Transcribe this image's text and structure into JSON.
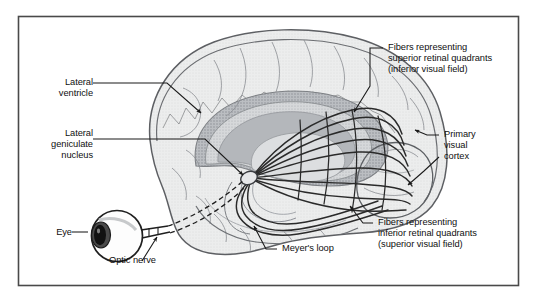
{
  "figure": {
    "frame_color": "#4a4a4a",
    "background_color": "#ffffff",
    "ink_color": "#1a1a1a"
  },
  "palette": {
    "cortex_fill": "#e9eaec",
    "cortex_stroke": "#5d5f63",
    "ventricle_outer": "#b9bcc0",
    "ventricle_inner": "#cfd2d5",
    "ventricle_core": "#a9acb1",
    "sulci_stroke": "#8a8d92",
    "fiber_stroke": "#2a2a2a",
    "eye_fill": "#fdfdfd",
    "iris_fill": "#3c3c3c",
    "pupil_fill": "#111111",
    "leader_stroke": "#1a1a1a"
  },
  "labels": {
    "lateral_ventricle": {
      "id": "lateral-ventricle",
      "lines": [
        "Lateral",
        "ventricle"
      ],
      "text": "Lateral\nventricle",
      "align": "right",
      "x": 38,
      "y": 77
    },
    "lateral_geniculate_nucleus": {
      "id": "lateral-geniculate-nucleus",
      "lines": [
        "Lateral",
        "geniculate",
        "nucleus"
      ],
      "text": "Lateral\ngeniculate\nnucleus",
      "align": "right",
      "x": 24,
      "y": 128
    },
    "eye": {
      "id": "eye",
      "lines": [
        "Eye"
      ],
      "text": "Eye",
      "align": "right",
      "x": 42,
      "y": 228
    },
    "optic_nerve": {
      "id": "optic-nerve",
      "lines": [
        "Optic nerve"
      ],
      "text": "Optic nerve",
      "align": "left",
      "x": 108,
      "y": 266
    },
    "meyers_loop": {
      "id": "meyers-loop",
      "lines": [
        "Meyer's loop"
      ],
      "text": "Meyer's loop",
      "align": "left",
      "x": 282,
      "y": 245
    },
    "fibers_superior": {
      "id": "fibers-superior-retinal-quadrants",
      "lines": [
        "Fibers representing",
        "superior retinal quadrants",
        "(inferior visual field)"
      ],
      "text": "Fibers representing\nsuperior retinal quadrants\n(inferior visual field)",
      "align": "left",
      "x": 387,
      "y": 44
    },
    "primary_visual_cortex": {
      "id": "primary-visual-cortex",
      "lines": [
        "Primary",
        "visual",
        "cortex"
      ],
      "text": "Primary\nvisual\ncortex",
      "align": "left",
      "x": 443,
      "y": 131
    },
    "fibers_inferior": {
      "id": "fibers-inferior-retinal-quadrants",
      "lines": [
        "Fibers representing",
        "inferior retinal quadrants",
        "(superior visual field)"
      ],
      "text": "Fibers representing\ninferior retinal quadrants\n(superior visual field)",
      "align": "left",
      "x": 377,
      "y": 219
    }
  },
  "structures": {
    "brain": "cerebral hemisphere, mid-sagittal lateral view",
    "lateral_ventricle": "concentric gray arcs in the centre of the hemisphere",
    "lgn": "small oval relay nucleus where optic nerve terminates",
    "optic_radiation": "fan of fibers sweeping from LGN posteriorly to occipital pole",
    "meyers_loop": "ventral fiber bundle looping forward into the temporal lobe",
    "occipital_pole": "primary visual cortex at the posterior end of the hemisphere",
    "eyeball": "globe with iris and pupil anterior to the brain",
    "optic_nerve": "dashed tube running from eyeball back to LGN"
  }
}
